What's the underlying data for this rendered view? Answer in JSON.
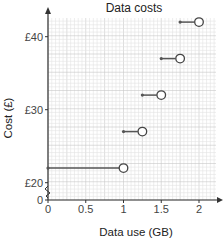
{
  "chart_data": {
    "type": "step",
    "title": "Data costs",
    "xlabel": "Data use (GB)",
    "ylabel": "Cost (£)",
    "xlim": [
      0,
      2.25
    ],
    "ylim": [
      20,
      42.5
    ],
    "y_axis_break": true,
    "x_ticks": [
      "0",
      "0.5",
      "1",
      "1.5",
      "2"
    ],
    "y_ticks": [
      "0",
      "£20",
      "£30",
      "£40"
    ],
    "grid": true,
    "segments": [
      {
        "x_start": 0,
        "x_end": 1,
        "cost": 22,
        "start": "closed",
        "end": "open"
      },
      {
        "x_start": 1,
        "x_end": 1.25,
        "cost": 27,
        "start": "closed",
        "end": "open"
      },
      {
        "x_start": 1.25,
        "x_end": 1.5,
        "cost": 32,
        "start": "closed",
        "end": "open"
      },
      {
        "x_start": 1.5,
        "x_end": 1.75,
        "cost": 37,
        "start": "closed",
        "end": "open"
      },
      {
        "x_start": 1.75,
        "x_end": 2,
        "cost": 42,
        "start": "closed",
        "end": "open"
      }
    ]
  }
}
